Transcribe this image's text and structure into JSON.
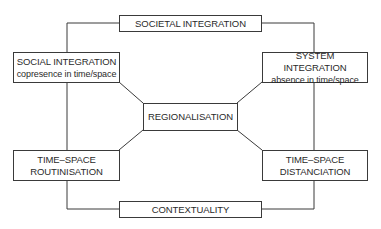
{
  "diagram": {
    "nodes": {
      "societal_integration": {
        "label": "SOCIETAL INTEGRATION"
      },
      "social_integration": {
        "label": "SOCIAL INTEGRATION",
        "sublabel": "copresence in time/space"
      },
      "system_integration": {
        "label": "SYSTEM INTEGRATION",
        "sublabel": "absence in time/space"
      },
      "regionalisation": {
        "label": "REGIONALISATION"
      },
      "routinisation": {
        "line1": "TIME–SPACE",
        "line2": "ROUTINISATION"
      },
      "distanciation": {
        "line1": "TIME–SPACE",
        "line2": "DISTANCIATION"
      },
      "contextuality": {
        "label": "CONTEXTUALITY"
      }
    },
    "edges": [
      [
        "societal_integration",
        "social_integration"
      ],
      [
        "societal_integration",
        "system_integration"
      ],
      [
        "social_integration",
        "routinisation"
      ],
      [
        "system_integration",
        "distanciation"
      ],
      [
        "routinisation",
        "contextuality"
      ],
      [
        "distanciation",
        "contextuality"
      ],
      [
        "regionalisation",
        "social_integration"
      ],
      [
        "regionalisation",
        "system_integration"
      ],
      [
        "regionalisation",
        "routinisation"
      ],
      [
        "regionalisation",
        "distanciation"
      ]
    ]
  }
}
